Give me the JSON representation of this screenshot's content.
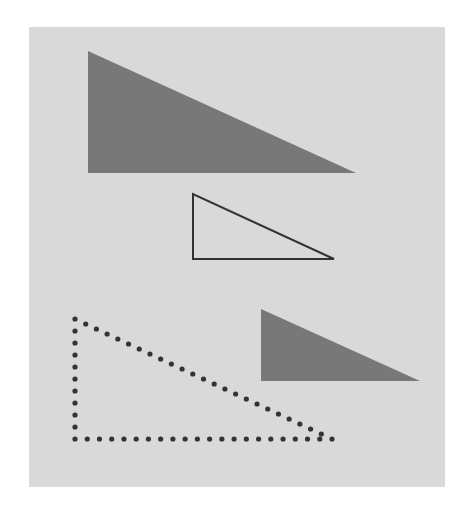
{
  "page": {
    "width": 462,
    "height": 510,
    "background": "#ffffff"
  },
  "panel": {
    "x": 29,
    "y": 27,
    "width": 416,
    "height": 460,
    "color": "#d9d9d9"
  },
  "triangles": [
    {
      "id": "large-filled",
      "style": "filled",
      "points": [
        [
          88,
          51
        ],
        [
          88,
          173
        ],
        [
          356,
          173
        ]
      ],
      "fill": "#787878"
    },
    {
      "id": "outline",
      "style": "outline",
      "points": [
        [
          193,
          194
        ],
        [
          193,
          259
        ],
        [
          334,
          259
        ]
      ],
      "stroke": "#333333",
      "stroke_width": 2
    },
    {
      "id": "small-filled",
      "style": "filled",
      "points": [
        [
          261,
          309
        ],
        [
          261,
          381
        ],
        [
          420,
          381
        ]
      ],
      "fill": "#787878"
    },
    {
      "id": "dotted",
      "style": "dotted",
      "points": [
        [
          75,
          319
        ],
        [
          75,
          439
        ],
        [
          332,
          439
        ]
      ],
      "dot_color": "#333333",
      "dot_radius": 2.6,
      "dot_spacing": 12
    }
  ]
}
